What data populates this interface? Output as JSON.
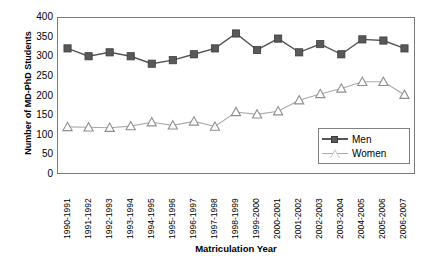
{
  "chart_data": {
    "type": "line",
    "title": "",
    "xlabel": "Matriculation Year",
    "ylabel": "Number of MD-PhD Students",
    "ylim": [
      0,
      400
    ],
    "yticks": [
      400,
      350,
      300,
      250,
      200,
      150,
      100,
      50,
      0
    ],
    "grid": false,
    "legend_position": "bottom-right",
    "categories": [
      "1990-1991",
      "1991-1992",
      "1992-1993",
      "1993-1994",
      "1994-1995",
      "1995-1996",
      "1996-1997",
      "1997-1998",
      "1998-1999",
      "1999-2000",
      "2000-2001",
      "2001-2002",
      "2002-2003",
      "2003-2004",
      "2004-2005",
      "2005-2006",
      "2006-2007"
    ],
    "series": [
      {
        "name": "Men",
        "marker": "square",
        "color": "#595959",
        "line_color": "#555555",
        "values": [
          320,
          300,
          310,
          300,
          281,
          290,
          305,
          320,
          358,
          316,
          345,
          310,
          331,
          305,
          343,
          340,
          320
        ]
      },
      {
        "name": "Women",
        "marker": "triangle",
        "color": "#c9c9c9",
        "line_color": "#aaaaaa",
        "values": [
          120,
          119,
          118,
          122,
          132,
          124,
          134,
          121,
          158,
          152,
          160,
          188,
          204,
          218,
          235,
          235,
          202
        ]
      }
    ]
  },
  "legend": {
    "items": [
      {
        "label": "Men"
      },
      {
        "label": "Women"
      }
    ]
  }
}
